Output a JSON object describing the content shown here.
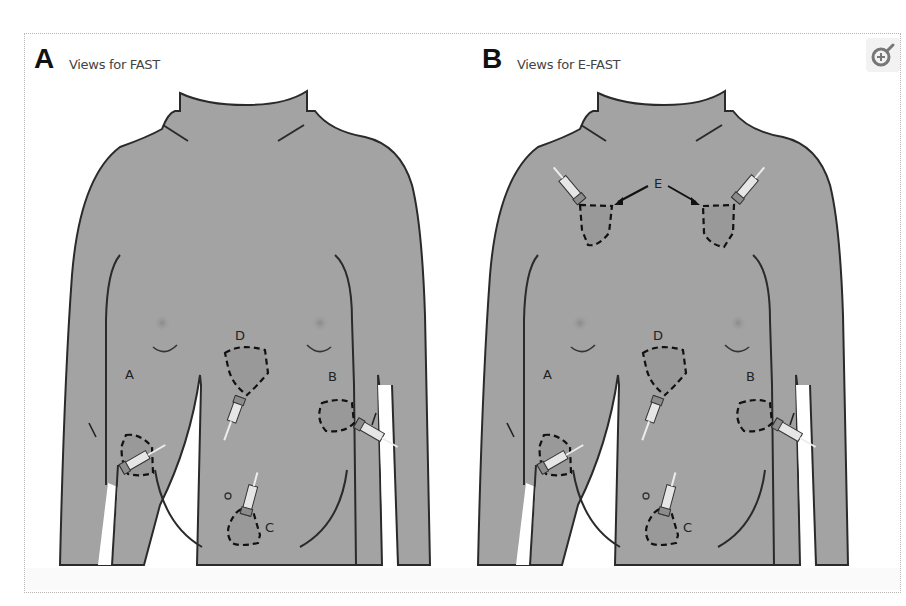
{
  "figure": {
    "panels": [
      {
        "letter": "A",
        "title": "Views for FAST",
        "views": [
          {
            "label": "A",
            "description": "right upper quadrant view"
          },
          {
            "label": "B",
            "description": "left upper quadrant view"
          },
          {
            "label": "C",
            "description": "suprapubic view"
          },
          {
            "label": "D",
            "description": "subxiphoid view"
          }
        ]
      },
      {
        "letter": "B",
        "title": "Views for E-FAST",
        "views": [
          {
            "label": "A",
            "description": "right upper quadrant view"
          },
          {
            "label": "B",
            "description": "left upper quadrant view"
          },
          {
            "label": "C",
            "description": "suprapubic view"
          },
          {
            "label": "D",
            "description": "subxiphoid view"
          },
          {
            "label": "E",
            "description": "bilateral anterior thoracic views"
          }
        ]
      }
    ],
    "zoom_button": {
      "icon": "zoom-in-icon"
    },
    "colors": {
      "body_fill": "#a3a3a3",
      "outline": "#2a2a2a",
      "dashed_region": "#1a1a1a",
      "background": "#ffffff"
    }
  }
}
